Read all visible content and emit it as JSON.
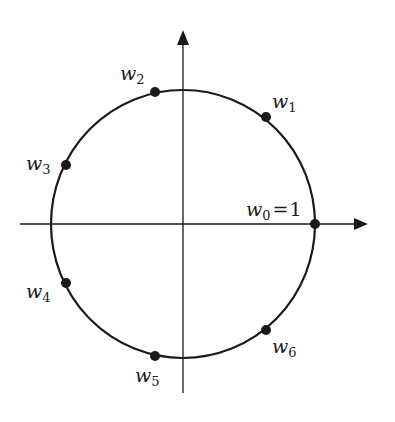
{
  "diagram": {
    "colors": {
      "stroke": "#1a1a1a",
      "background": "#ffffff"
    },
    "circle": {
      "cx": 183,
      "cy": 224,
      "rx": 132,
      "ry": 134
    },
    "axes": {
      "x": {
        "x1": 20,
        "x2": 368,
        "y": 224
      },
      "y": {
        "x": 183,
        "y1": 28,
        "y2": 393
      }
    },
    "points": [
      {
        "name": "w0",
        "base": "w",
        "sub": "0",
        "suffix": "=1",
        "x": 315,
        "y": 224
      },
      {
        "name": "w1",
        "base": "w",
        "sub": "1",
        "x": 266,
        "y": 117
      },
      {
        "name": "w2",
        "base": "w",
        "sub": "2",
        "x": 155,
        "y": 91
      },
      {
        "name": "w3",
        "base": "w",
        "sub": "3",
        "x": 66,
        "y": 165
      },
      {
        "name": "w4",
        "base": "w",
        "sub": "4",
        "x": 66,
        "y": 283
      },
      {
        "name": "w5",
        "base": "w",
        "sub": "5",
        "x": 155,
        "y": 355
      },
      {
        "name": "w6",
        "base": "w",
        "sub": "6",
        "x": 266,
        "y": 330
      }
    ],
    "labels": {
      "w0": {
        "base": "w",
        "sub": "0",
        "eq": "=",
        "val": "1"
      },
      "w1": {
        "base": "w",
        "sub": "1"
      },
      "w2": {
        "base": "w",
        "sub": "2"
      },
      "w3": {
        "base": "w",
        "sub": "3"
      },
      "w4": {
        "base": "w",
        "sub": "4"
      },
      "w5": {
        "base": "w",
        "sub": "5"
      },
      "w6": {
        "base": "w",
        "sub": "6"
      }
    }
  }
}
